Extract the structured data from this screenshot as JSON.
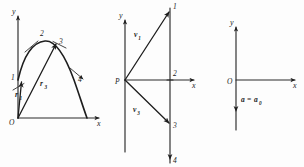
{
  "figure": {
    "caption": "",
    "background_color": "#fdfdfd",
    "ink_color": "#1a1a1a",
    "panels": [
      {
        "id": "trajectory",
        "name": "projectile-trajectory",
        "axes": {
          "y_label": "y",
          "x_label": "x",
          "origin_label": "O"
        },
        "curve_points": [
          "1",
          "2",
          "3",
          "4"
        ],
        "vectors": [
          {
            "name": "r1",
            "base": "r",
            "subscript": "1"
          },
          {
            "name": "r3",
            "base": "r",
            "subscript": "3"
          }
        ]
      },
      {
        "id": "hodograph",
        "name": "velocity-hodograph",
        "axes": {
          "y_label": "y",
          "x_label": "x",
          "origin_label": "P"
        },
        "curve_points": [
          "1",
          "2",
          "3",
          "4"
        ],
        "vectors": [
          {
            "name": "v1",
            "base": "v",
            "subscript": "1"
          },
          {
            "name": "v3",
            "base": "v",
            "subscript": "3"
          }
        ]
      },
      {
        "id": "acceleration",
        "name": "acceleration-diagram",
        "axes": {
          "y_label": "y",
          "x_label": "x",
          "origin_label": "O"
        },
        "curve_points": [],
        "vectors": [
          {
            "name": "a",
            "base": "a",
            "subscript": ""
          }
        ],
        "annotation": {
          "lhs": "a",
          "equals": "=",
          "rhs": "a",
          "rhs_subscript": "0"
        }
      }
    ]
  },
  "labels": {
    "y": "y",
    "x": "x",
    "O": "O",
    "P": "P",
    "p1": "1",
    "p2": "2",
    "p3": "3",
    "p4": "4",
    "r": "r",
    "v": "v",
    "a": "a",
    "sub1": "1",
    "sub2": "2",
    "sub3": "3",
    "sub0": "0",
    "equals": "="
  }
}
